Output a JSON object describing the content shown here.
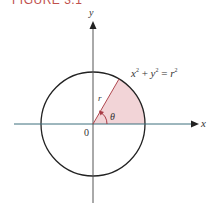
{
  "figure": {
    "title": "FIGURE 3.1",
    "colors": {
      "title": "#c0504d",
      "sector_fill": "#f2d4d7",
      "radius_line": "#b0474f",
      "angle_arrow": "#a83a44",
      "x_axis": "#3d6f7c",
      "y_axis": "#333333",
      "circle": "#222222"
    }
  },
  "labels": {
    "x_axis": "x",
    "y_axis": "y",
    "origin": "0",
    "radius": "r",
    "angle": "θ",
    "equation": {
      "x": "x",
      "y": "y",
      "r": "r",
      "exp": "2",
      "plus": "+",
      "equals": "="
    }
  },
  "geometry": {
    "center": [
      93,
      124
    ],
    "radius": 52,
    "sector_angle_deg": 60
  }
}
